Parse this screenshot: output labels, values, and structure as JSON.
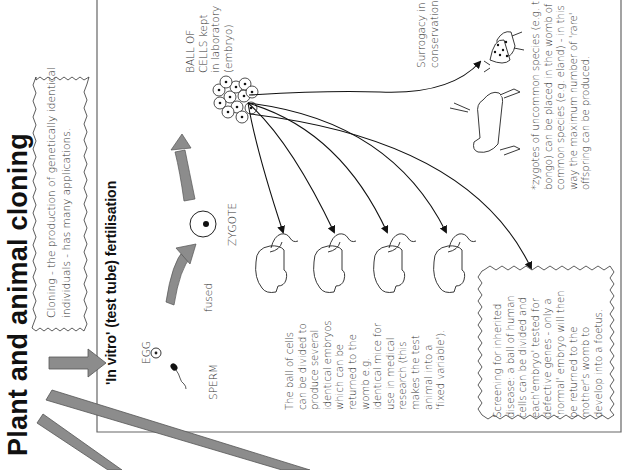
{
  "title": "Plant and animal cloning",
  "intro_box": {
    "lines": [
      "Cloning - the production of genetically identical",
      "individuals - has many applications."
    ]
  },
  "section": {
    "heading": "'In vitro' (test tube) fertilisation",
    "labels": {
      "egg": "EGG",
      "sperm": "SPERM",
      "fused": "fused",
      "zygote": "ZYGOTE",
      "ball_of_cells": [
        "BALL OF",
        "CELLS kept",
        "in laboratory",
        "(embryo)"
      ],
      "surrogacy": [
        "Surrogacy in",
        "conservation"
      ]
    },
    "mice_text": [
      "The ball of cells",
      "can be divided to",
      "produce several",
      "identical embryos",
      "which can be",
      "returned to the",
      "womb e.g.",
      "identical mice for",
      "use in medical",
      "research (this",
      "makes the test",
      "animal into a",
      "'fixed variable')."
    ],
    "screening_box": [
      "Screening for inherited",
      "disease: a ball of human",
      "cells can be divided and",
      "each'embryo' tested for",
      "defective genes - only a",
      "'normal' embryo will then",
      "be returned to the",
      "mother's womb to",
      "develop into a foetus."
    ],
    "conservation_note": [
      "*zygotes of uncommon species (e.g. the",
      "bongo) can be placed in the womb of a",
      "common species (e.g. eland) - in this",
      "way the maximum number of 'rare'",
      "offspring can be produced."
    ]
  },
  "colors": {
    "arrow_grey": "#8c8c8c",
    "border": "#555555",
    "text": "#333333"
  }
}
